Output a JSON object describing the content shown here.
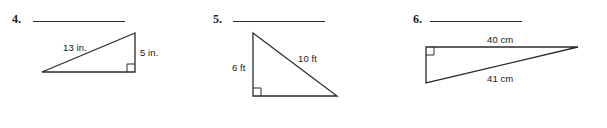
{
  "page": {
    "background_color": "#ffffff",
    "stroke_color": "#2b2b2b",
    "text_color": "#171717",
    "width": 607,
    "height": 128
  },
  "problems": [
    {
      "number": "4.",
      "shape": "right-triangle",
      "orientation": "right-angle-bottom-right",
      "answer_line": {
        "x": 33,
        "y": 21,
        "width": 92
      },
      "labels": [
        {
          "name": "hypotenuse-label",
          "text": "13 in.",
          "x": 63,
          "y": 43
        },
        {
          "name": "leg-label",
          "text": "5 in.",
          "x": 140,
          "y": 48
        }
      ],
      "vertices": {
        "apex": [
          135,
          33
        ],
        "left": [
          42,
          72
        ],
        "corner": [
          135,
          72
        ]
      }
    },
    {
      "number": "5.",
      "shape": "right-triangle",
      "orientation": "right-angle-bottom-left",
      "answer_line": {
        "x": 233,
        "y": 21,
        "width": 92
      },
      "labels": [
        {
          "name": "leg-label",
          "text": "6 ft",
          "x": 232,
          "y": 63
        },
        {
          "name": "hypotenuse-label",
          "text": "10 ft",
          "x": 298,
          "y": 54
        }
      ],
      "vertices": {
        "apex": [
          253,
          33
        ],
        "corner": [
          253,
          96
        ],
        "right": [
          337,
          96
        ]
      }
    },
    {
      "number": "6.",
      "shape": "right-triangle",
      "orientation": "right-angle-top-left",
      "answer_line": {
        "x": 430,
        "y": 21,
        "width": 92
      },
      "labels": [
        {
          "name": "leg-label",
          "text": "40 cm",
          "x": 487,
          "y": 35
        },
        {
          "name": "hypotenuse-label",
          "text": "41 cm",
          "x": 487,
          "y": 74
        }
      ],
      "vertices": {
        "corner": [
          426,
          47
        ],
        "right": [
          578,
          47
        ],
        "bottom": [
          426,
          83
        ]
      }
    }
  ]
}
